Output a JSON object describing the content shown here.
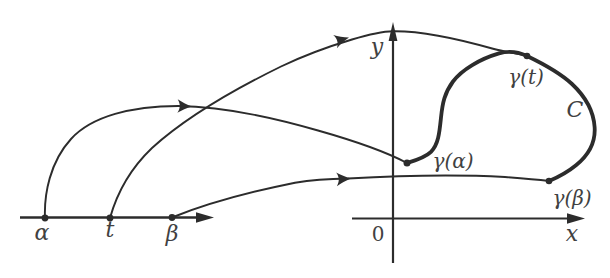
{
  "figure": {
    "background": "#ffffff",
    "ink": "#2c2c2c",
    "label_ink": "#414141",
    "domain_line": {
      "points": [
        {
          "name": "alpha",
          "label": "α"
        },
        {
          "name": "t",
          "label": "t"
        },
        {
          "name": "beta",
          "label": "β"
        }
      ]
    },
    "plane": {
      "origin_label": "0",
      "x_axis_label": "x",
      "y_axis_label": "y"
    },
    "curve": {
      "label": "C",
      "points": [
        {
          "name": "gamma-t",
          "label": "γ(t)"
        },
        {
          "name": "gamma-alpha",
          "label": "γ(α)"
        },
        {
          "name": "gamma-beta",
          "label": "γ(β)"
        }
      ]
    }
  }
}
